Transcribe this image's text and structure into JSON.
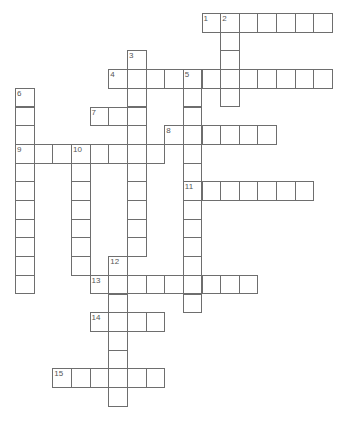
{
  "puzzle": {
    "type": "crossword",
    "cell_size": 18.65,
    "cell_size_y": 18.7,
    "origin": {
      "x": 15,
      "y": 13
    },
    "colors": {
      "background": "#ffffff",
      "border": "#6e6e6e",
      "number": "#555555"
    },
    "entries": [
      {
        "number": "1",
        "direction": "across",
        "col": 10,
        "row": 0,
        "length": 7
      },
      {
        "number": "2",
        "direction": "down",
        "col": 11,
        "row": 0,
        "length": 5
      },
      {
        "number": "3",
        "direction": "down",
        "col": 6,
        "row": 2,
        "length": 11
      },
      {
        "number": "4",
        "direction": "across",
        "col": 5,
        "row": 3,
        "length": 12
      },
      {
        "number": "5",
        "direction": "down",
        "col": 9,
        "row": 3,
        "length": 13
      },
      {
        "number": "6",
        "direction": "down",
        "col": 0,
        "row": 4,
        "length": 11
      },
      {
        "number": "7",
        "direction": "across",
        "col": 4,
        "row": 5,
        "length": 3
      },
      {
        "number": "8",
        "direction": "across",
        "col": 8,
        "row": 6,
        "length": 6
      },
      {
        "number": "9",
        "direction": "across",
        "col": 0,
        "row": 7,
        "length": 8
      },
      {
        "number": "10",
        "direction": "down",
        "col": 3,
        "row": 7,
        "length": 7
      },
      {
        "number": "11",
        "direction": "across",
        "col": 9,
        "row": 9,
        "length": 7
      },
      {
        "number": "12",
        "direction": "down",
        "col": 5,
        "row": 13,
        "length": 8
      },
      {
        "number": "13",
        "direction": "across",
        "col": 4,
        "row": 14,
        "length": 9
      },
      {
        "number": "14",
        "direction": "across",
        "col": 4,
        "row": 16,
        "length": 4
      },
      {
        "number": "15",
        "direction": "across",
        "col": 2,
        "row": 19,
        "length": 6
      }
    ]
  }
}
